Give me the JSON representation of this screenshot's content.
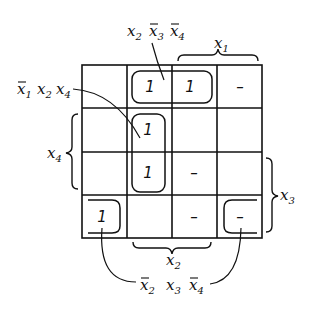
{
  "diagram": {
    "type": "karnaugh-map",
    "grid": {
      "rows": 4,
      "cols": 4,
      "cells": [
        [
          "",
          "1",
          "1",
          "–"
        ],
        [
          "",
          "1",
          "",
          ""
        ],
        [
          "",
          "1",
          "–",
          ""
        ],
        [
          "1",
          "",
          "–",
          "–"
        ]
      ]
    },
    "variables": {
      "top": "x1",
      "left": "x4",
      "right": "x3",
      "bottom": "x2"
    },
    "groups": [
      {
        "label": "x2 x̄3 x̄4",
        "cells": [
          [
            0,
            1
          ],
          [
            0,
            2
          ]
        ]
      },
      {
        "label": "x̄1 x2 x4",
        "cells": [
          [
            1,
            1
          ],
          [
            2,
            1
          ]
        ]
      },
      {
        "label": "x̄2 x3 x̄4",
        "cells": [
          [
            3,
            0
          ],
          [
            3,
            3
          ]
        ]
      }
    ],
    "labels": {
      "top_var": "x",
      "top_sub": "1",
      "left_var": "x",
      "left_sub": "4",
      "right_var": "x",
      "right_sub": "3",
      "bottom_var": "x",
      "bottom_sub": "2",
      "g1_a": "x",
      "g1_a_sub": "2",
      "g1_b": "x",
      "g1_b_sub": "3",
      "g1_c": "x",
      "g1_c_sub": "4",
      "g2_a": "x",
      "g2_a_sub": "1",
      "g2_b": "x",
      "g2_b_sub": "2",
      "g2_c": "x",
      "g2_c_sub": "4",
      "g3_a": "x",
      "g3_a_sub": "2",
      "g3_b": "x",
      "g3_b_sub": "3",
      "g3_c": "x",
      "g3_c_sub": "4"
    }
  }
}
